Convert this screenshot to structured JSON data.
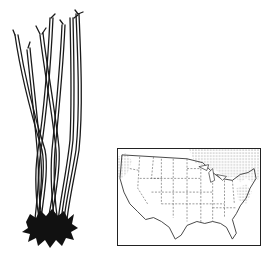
{
  "illustration": {
    "subject": "bundle of bare-root woody plant stems",
    "colors": {
      "ink": "#1a1a1a",
      "paper": "#ffffff",
      "hatch": "#888888"
    }
  },
  "range_map": {
    "region": "contiguous United States with state boundaries",
    "shaded_regions": [
      "northeast",
      "great-lakes",
      "pacific-northwest",
      "southern-canada"
    ]
  }
}
